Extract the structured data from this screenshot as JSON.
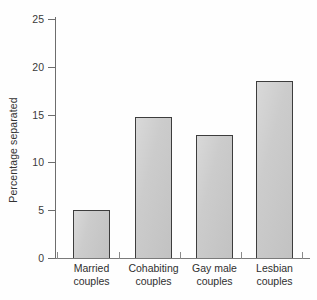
{
  "chart_data": {
    "type": "bar",
    "title": "",
    "subtitle": "",
    "xlabel": "",
    "ylabel": "Percentage separated",
    "categories": [
      "Married couples",
      "Cohabiting couples",
      "Gay male couples",
      "Lesbian couples"
    ],
    "category_lines": [
      [
        "Married",
        "couples"
      ],
      [
        "Cohabiting",
        "couples"
      ],
      [
        "Gay male",
        "couples"
      ],
      [
        "Lesbian",
        "couples"
      ]
    ],
    "values": [
      5.0,
      14.8,
      12.9,
      18.5
    ],
    "ylim": [
      0,
      25
    ],
    "yticks": [
      0,
      5,
      10,
      15,
      20,
      25
    ],
    "ytick_labels": [
      "0",
      "5",
      "10",
      "15",
      "20",
      "25"
    ],
    "grid": false,
    "legend": null,
    "bar_fill_color": "#c9c9c9",
    "bar_edge_color": "#3d3d3d",
    "axis_color": "#6d6d6d",
    "background_color": "#fefefe",
    "text_color": "#2f2f2f"
  }
}
